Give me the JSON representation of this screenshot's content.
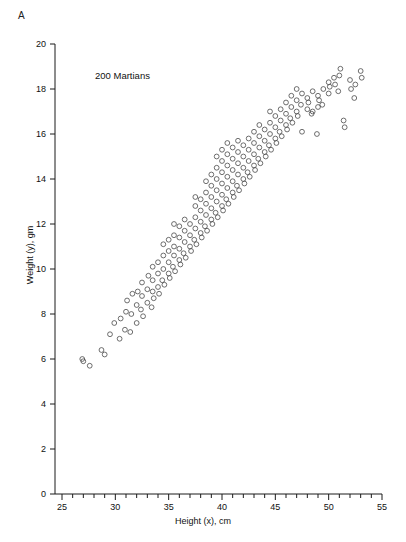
{
  "figure": {
    "panel_label": "A",
    "annotation": "200 Martians",
    "background_color": "#ffffff",
    "marker_color": "#4a4a4a",
    "axis_color": "#1a1a1a"
  },
  "chart_data": {
    "type": "scatter",
    "title": "",
    "annotation": "200 Martians",
    "panel_label": "A",
    "xlabel": "Height (x), cm",
    "ylabel": "Weight (y), gm",
    "xlim": [
      25,
      55
    ],
    "ylim": [
      0,
      20
    ],
    "xticks": [
      25,
      26,
      27,
      28,
      29,
      30,
      31,
      32,
      33,
      34,
      35,
      36,
      37,
      38,
      39,
      40,
      41,
      42,
      43,
      44,
      45,
      46,
      47,
      48,
      49,
      50,
      51,
      52,
      53,
      54,
      55
    ],
    "xticklabels": [
      "25",
      "",
      "",
      "",
      "",
      "30",
      "",
      "",
      "",
      "",
      "35",
      "",
      "",
      "",
      "",
      "40",
      "",
      "",
      "",
      "",
      "45",
      "",
      "",
      "",
      "",
      "50",
      "",
      "",
      "",
      "",
      "55"
    ],
    "yticks": [
      0,
      2,
      4,
      6,
      8,
      10,
      12,
      14,
      16,
      18,
      20
    ],
    "yticklabels": [
      "0",
      "2",
      "4",
      "6",
      "8",
      "10",
      "12",
      "14",
      "16",
      "18",
      "20"
    ],
    "grid": false,
    "legend": false,
    "n_points": 200,
    "marker": "open-circle",
    "series": [
      {
        "name": "Martians",
        "x": [
          26.9,
          27.0,
          27.6,
          28.7,
          29.0,
          29.5,
          29.9,
          30.4,
          30.5,
          30.9,
          31.0,
          31.1,
          31.4,
          31.5,
          31.6,
          32.0,
          32.0,
          32.1,
          32.4,
          32.5,
          32.5,
          32.6,
          33.0,
          33.0,
          33.1,
          33.4,
          33.5,
          33.5,
          33.5,
          33.6,
          34.0,
          34.0,
          34.0,
          34.1,
          34.4,
          34.5,
          34.5,
          34.5,
          34.6,
          35.0,
          35.0,
          35.0,
          35.0,
          35.1,
          35.4,
          35.5,
          35.5,
          35.5,
          35.5,
          35.6,
          36.0,
          36.0,
          36.0,
          36.0,
          36.1,
          36.4,
          36.5,
          36.5,
          36.5,
          36.6,
          37.0,
          37.0,
          37.0,
          37.1,
          37.4,
          37.5,
          37.5,
          37.5,
          37.5,
          37.6,
          38.0,
          38.0,
          38.0,
          38.0,
          38.1,
          38.4,
          38.5,
          38.5,
          38.5,
          38.5,
          38.6,
          39.0,
          39.0,
          39.0,
          39.0,
          39.0,
          39.1,
          39.4,
          39.5,
          39.5,
          39.5,
          39.5,
          39.5,
          39.6,
          40.0,
          40.0,
          40.0,
          40.0,
          40.0,
          40.0,
          40.1,
          40.4,
          40.5,
          40.5,
          40.5,
          40.5,
          40.5,
          40.6,
          41.0,
          41.0,
          41.0,
          41.0,
          41.0,
          41.1,
          41.4,
          41.5,
          41.5,
          41.5,
          41.5,
          41.6,
          42.0,
          42.0,
          42.0,
          42.0,
          42.1,
          42.4,
          42.5,
          42.5,
          42.5,
          42.6,
          43.0,
          43.0,
          43.0,
          43.0,
          43.1,
          43.4,
          43.5,
          43.5,
          43.5,
          43.6,
          44.0,
          44.0,
          44.0,
          44.1,
          44.4,
          44.5,
          44.5,
          44.5,
          44.6,
          45.0,
          45.0,
          45.0,
          45.1,
          45.4,
          45.5,
          45.5,
          45.6,
          46.0,
          46.0,
          46.0,
          46.1,
          46.4,
          46.5,
          46.5,
          46.6,
          47.0,
          47.0,
          47.0,
          47.1,
          47.4,
          47.5,
          47.5,
          48.0,
          48.0,
          48.1,
          48.4,
          48.5,
          48.5,
          49.0,
          49.0,
          49.1,
          49.4,
          49.5,
          50.0,
          50.0,
          50.1,
          50.5,
          50.6,
          51.0,
          51.1,
          51.4,
          51.5,
          52.0,
          52.1,
          52.4,
          52.5,
          53.0,
          53.1,
          50.9,
          48.9
        ],
        "y": [
          6.0,
          5.9,
          5.7,
          6.4,
          6.2,
          7.1,
          7.6,
          6.9,
          7.8,
          7.3,
          8.1,
          8.6,
          7.2,
          8.0,
          8.9,
          7.6,
          8.4,
          9.0,
          8.2,
          8.8,
          9.4,
          7.9,
          8.5,
          9.1,
          9.7,
          8.3,
          9.0,
          9.5,
          10.1,
          8.7,
          9.2,
          9.8,
          10.3,
          8.9,
          9.5,
          10.0,
          10.6,
          11.1,
          9.3,
          9.8,
          10.3,
          10.8,
          11.3,
          9.6,
          10.1,
          10.6,
          11.0,
          11.5,
          12.0,
          9.9,
          10.4,
          10.9,
          11.4,
          11.9,
          10.2,
          10.7,
          11.2,
          11.7,
          12.2,
          10.5,
          11.0,
          11.5,
          12.0,
          10.8,
          11.3,
          11.8,
          12.3,
          12.8,
          13.2,
          11.1,
          11.6,
          12.1,
          12.6,
          13.1,
          11.4,
          11.9,
          12.4,
          12.9,
          13.4,
          13.9,
          11.7,
          12.2,
          12.7,
          13.2,
          13.7,
          14.2,
          12.0,
          12.5,
          13.0,
          13.5,
          14.0,
          14.5,
          15.0,
          12.3,
          12.8,
          13.3,
          13.8,
          14.3,
          14.8,
          15.3,
          12.6,
          13.1,
          13.6,
          14.1,
          14.6,
          15.1,
          15.6,
          12.9,
          13.4,
          13.9,
          14.4,
          14.9,
          15.4,
          13.2,
          13.7,
          14.2,
          14.7,
          15.2,
          15.7,
          13.5,
          14.0,
          14.5,
          15.0,
          15.5,
          13.8,
          14.3,
          14.8,
          15.3,
          15.8,
          14.1,
          14.6,
          15.1,
          15.6,
          16.1,
          14.4,
          14.9,
          15.4,
          15.9,
          16.4,
          14.7,
          15.2,
          15.7,
          16.2,
          15.0,
          15.5,
          16.0,
          16.5,
          17.0,
          15.3,
          15.8,
          16.3,
          16.8,
          15.6,
          16.1,
          16.6,
          17.1,
          15.9,
          16.4,
          16.9,
          17.4,
          16.2,
          16.7,
          17.2,
          17.7,
          16.5,
          17.0,
          17.5,
          18.0,
          16.8,
          17.3,
          17.8,
          16.1,
          17.1,
          17.6,
          17.4,
          16.9,
          17.9,
          17.0,
          17.2,
          17.7,
          17.5,
          17.3,
          18.0,
          17.8,
          18.3,
          18.1,
          18.5,
          18.2,
          18.6,
          18.9,
          16.6,
          16.3,
          18.4,
          18.0,
          17.6,
          18.2,
          18.8,
          18.5,
          17.9,
          16.0
        ]
      }
    ]
  },
  "axes": {
    "x": {
      "label": "Height (x), cm",
      "min": 25,
      "max": 55
    },
    "y": {
      "label": "Weight (y), gm",
      "min": 0,
      "max": 20
    }
  }
}
